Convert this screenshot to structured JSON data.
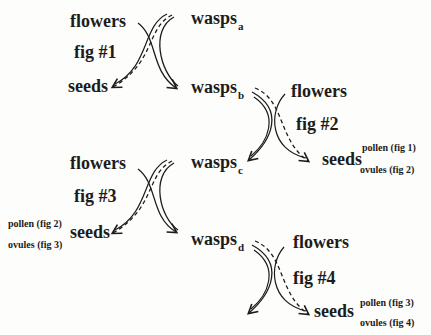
{
  "diagram": {
    "colors": {
      "ink": "#1c1c1c",
      "background": "#fdfdfb"
    },
    "stages": [
      {
        "fig": "fig #1",
        "flowers": "flowers",
        "seeds": "seeds",
        "wasps_in": {
          "text": "wasps",
          "sub": "a"
        },
        "wasps_out": {
          "text": "wasps",
          "sub": "b"
        }
      },
      {
        "fig": "fig #2",
        "flowers": "flowers",
        "seeds": "seeds",
        "wasps_in": {
          "text": "wasps",
          "sub": "b"
        },
        "wasps_out": {
          "text": "wasps",
          "sub": "c"
        },
        "seed_pollen": "pollen (fig 1)",
        "seed_ovules": "ovules (fig 2)"
      },
      {
        "fig": "fig #3",
        "flowers": "flowers",
        "seeds": "seeds",
        "wasps_in": {
          "text": "wasps",
          "sub": "c"
        },
        "wasps_out": {
          "text": "wasps",
          "sub": "d"
        },
        "seed_pollen": "pollen (fig 2)",
        "seed_ovules": "ovules (fig 3)"
      },
      {
        "fig": "fig #4",
        "flowers": "flowers",
        "seeds": "seeds",
        "wasps_in": {
          "text": "wasps",
          "sub": "d"
        },
        "seed_pollen": "pollen (fig 3)",
        "seed_ovules": "ovules (fig 4)"
      }
    ]
  }
}
